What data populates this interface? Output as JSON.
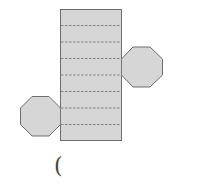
{
  "diagram": {
    "type": "net-of-octagonal-prism",
    "colors": {
      "fill": "#d6d6d6",
      "stroke": "#6e6e6e",
      "fold_line": "#7a7a7a",
      "background": "#ffffff"
    },
    "lateral_faces": 8,
    "bases": 2,
    "answer_blank": "("
  }
}
